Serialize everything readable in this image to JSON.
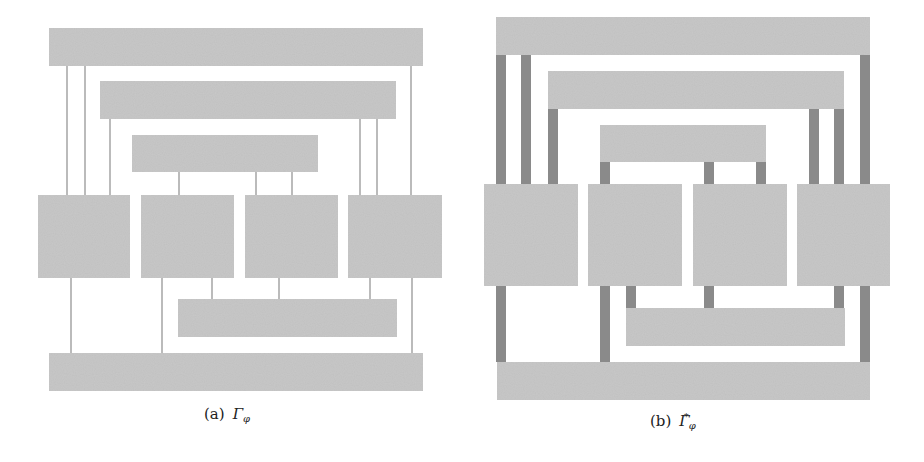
{
  "colors": {
    "block": "#c9c9c9",
    "thin_edge": "#8f8f8f",
    "thick_edge": "#8a8a8a",
    "caption": "#222222"
  },
  "panels": [
    {
      "id": "a",
      "caption": {
        "label": "(a)",
        "symbol": "Γ",
        "subscript": "φ",
        "superscript": ""
      },
      "caption_pos": {
        "x": 204,
        "y": 405
      },
      "edge_style": "thin",
      "bars": [
        {
          "name": "top-bar",
          "x": 49,
          "y": 28,
          "w": 374,
          "h": 38
        },
        {
          "name": "second-bar",
          "x": 100,
          "y": 81,
          "w": 296,
          "h": 38
        },
        {
          "name": "third-bar",
          "x": 132,
          "y": 135,
          "w": 186,
          "h": 37
        },
        {
          "name": "inner-bottom-bar",
          "x": 178,
          "y": 299,
          "w": 219,
          "h": 38
        },
        {
          "name": "bottom-bar",
          "x": 49,
          "y": 353,
          "w": 374,
          "h": 38
        }
      ],
      "blocks": [
        {
          "name": "block-1",
          "x": 38,
          "y": 195,
          "w": 92,
          "h": 83
        },
        {
          "name": "block-2",
          "x": 141,
          "y": 195,
          "w": 93,
          "h": 83
        },
        {
          "name": "block-3",
          "x": 245,
          "y": 195,
          "w": 93,
          "h": 83
        },
        {
          "name": "block-4",
          "x": 348,
          "y": 195,
          "w": 94,
          "h": 83
        }
      ],
      "edges": [
        {
          "x": 67,
          "y1": 66,
          "y2": 195
        },
        {
          "x": 85,
          "y1": 66,
          "y2": 195
        },
        {
          "x": 411,
          "y1": 66,
          "y2": 195
        },
        {
          "x": 110,
          "y1": 119,
          "y2": 195
        },
        {
          "x": 360,
          "y1": 119,
          "y2": 195
        },
        {
          "x": 377,
          "y1": 119,
          "y2": 195
        },
        {
          "x": 179,
          "y1": 172,
          "y2": 195
        },
        {
          "x": 256,
          "y1": 172,
          "y2": 195
        },
        {
          "x": 292,
          "y1": 172,
          "y2": 195
        },
        {
          "x": 71,
          "y1": 278,
          "y2": 353
        },
        {
          "x": 162,
          "y1": 278,
          "y2": 353
        },
        {
          "x": 412,
          "y1": 278,
          "y2": 353
        },
        {
          "x": 212,
          "y1": 278,
          "y2": 299
        },
        {
          "x": 279,
          "y1": 278,
          "y2": 299
        },
        {
          "x": 370,
          "y1": 278,
          "y2": 299
        }
      ]
    },
    {
      "id": "b",
      "caption": {
        "label": "(b)",
        "symbol": "Γ",
        "subscript": "φ",
        "superscript": "*"
      },
      "caption_pos": {
        "x": 650,
        "y": 411
      },
      "edge_style": "thick",
      "bars": [
        {
          "name": "top-bar",
          "x": 496,
          "y": 17,
          "w": 374,
          "h": 38
        },
        {
          "name": "second-bar",
          "x": 548,
          "y": 71,
          "w": 296,
          "h": 38
        },
        {
          "name": "third-bar",
          "x": 600,
          "y": 125,
          "w": 166,
          "h": 37
        },
        {
          "name": "inner-bottom-bar",
          "x": 626,
          "y": 308,
          "w": 219,
          "h": 38
        },
        {
          "name": "bottom-bar",
          "x": 497,
          "y": 362,
          "w": 373,
          "h": 38
        }
      ],
      "blocks": [
        {
          "name": "block-1",
          "x": 484,
          "y": 184,
          "w": 94,
          "h": 102
        },
        {
          "name": "block-2",
          "x": 588,
          "y": 184,
          "w": 94,
          "h": 102
        },
        {
          "name": "block-3",
          "x": 693,
          "y": 184,
          "w": 94,
          "h": 102
        },
        {
          "name": "block-4",
          "x": 797,
          "y": 184,
          "w": 93,
          "h": 102
        }
      ],
      "edges": [
        {
          "x": 496,
          "y1": 55,
          "y2": 184
        },
        {
          "x": 521,
          "y1": 55,
          "y2": 184
        },
        {
          "x": 860,
          "y1": 55,
          "y2": 184
        },
        {
          "x": 548,
          "y1": 109,
          "y2": 184
        },
        {
          "x": 809,
          "y1": 109,
          "y2": 184
        },
        {
          "x": 834,
          "y1": 109,
          "y2": 184
        },
        {
          "x": 600,
          "y1": 162,
          "y2": 184
        },
        {
          "x": 704,
          "y1": 162,
          "y2": 184
        },
        {
          "x": 756,
          "y1": 162,
          "y2": 184
        },
        {
          "x": 496,
          "y1": 286,
          "y2": 362
        },
        {
          "x": 600,
          "y1": 286,
          "y2": 362
        },
        {
          "x": 860,
          "y1": 286,
          "y2": 362
        },
        {
          "x": 626,
          "y1": 286,
          "y2": 308
        },
        {
          "x": 704,
          "y1": 286,
          "y2": 308
        },
        {
          "x": 834,
          "y1": 286,
          "y2": 308
        }
      ]
    }
  ]
}
